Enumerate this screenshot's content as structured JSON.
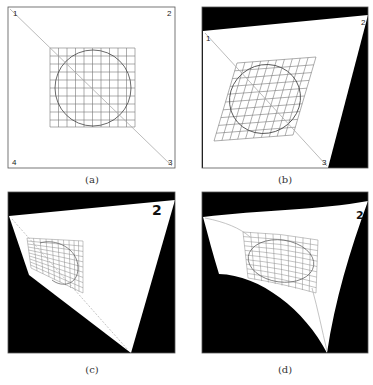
{
  "figure": {
    "panels": [
      {
        "id": "a",
        "caption": "(a)",
        "description": "Original image: square frame with 10x10 grid and inscribed circle, diagonal from corner 1 to corner 3",
        "corner_labels": [
          "1",
          "2",
          "3",
          "4"
        ]
      },
      {
        "id": "b",
        "caption": "(b)",
        "description": "Affine/perspective-warped image: grid becomes parallelogram, circle becomes ellipse, black regions outside warped quad",
        "corner_labels": [
          "1",
          "2",
          "3"
        ]
      },
      {
        "id": "c",
        "caption": "(c)",
        "description": "Strong perspective warp: large '2' label at top-right corner, grid foreshortened on left",
        "corner_labels": [
          "2"
        ]
      },
      {
        "id": "d",
        "caption": "(d)",
        "description": "Nonlinear (curved) warp: boundary edges curved, grid and ellipse distorted",
        "corner_labels": [
          "2"
        ]
      }
    ],
    "colors": {
      "background": "#ffffff",
      "outside_region": "#000000",
      "frame": "#555555",
      "grid": "#777777",
      "circle": "#444444",
      "diagonal": "#999999"
    }
  }
}
